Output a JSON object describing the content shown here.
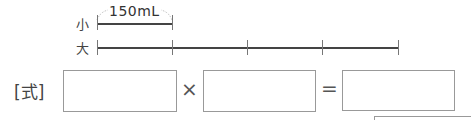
{
  "diagram": {
    "small_label": "小",
    "large_label": "大",
    "amount_label": "150mL",
    "ticks_count": 5
  },
  "equation": {
    "prefix": "[式]",
    "times": "×",
    "equals": "="
  }
}
